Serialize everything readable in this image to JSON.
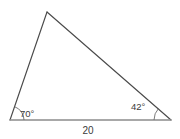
{
  "figure": {
    "type": "geometry-diagram",
    "shape": "triangle",
    "background_color": "#ffffff",
    "edge_color": "#4a4a4a",
    "base_color": "#8c8c8c",
    "label_color": "#3b3b3b",
    "vertices": [
      {
        "name": "left-vertex",
        "x": 10,
        "y": 120
      },
      {
        "name": "apex-vertex",
        "x": 47,
        "y": 12
      },
      {
        "name": "right-vertex",
        "x": 171,
        "y": 120
      }
    ],
    "angles": [
      {
        "name": "left-angle",
        "value": "70°",
        "vertex": "left-vertex",
        "label_x": 20,
        "label_y": 117,
        "arc": true
      },
      {
        "name": "right-angle",
        "value": "42°",
        "vertex": "right-vertex",
        "label_x": 131,
        "label_y": 110,
        "arc": true
      }
    ],
    "side_labels": [
      {
        "name": "base-length",
        "value": "20",
        "x": 88,
        "y": 134,
        "side": "base"
      }
    ]
  }
}
